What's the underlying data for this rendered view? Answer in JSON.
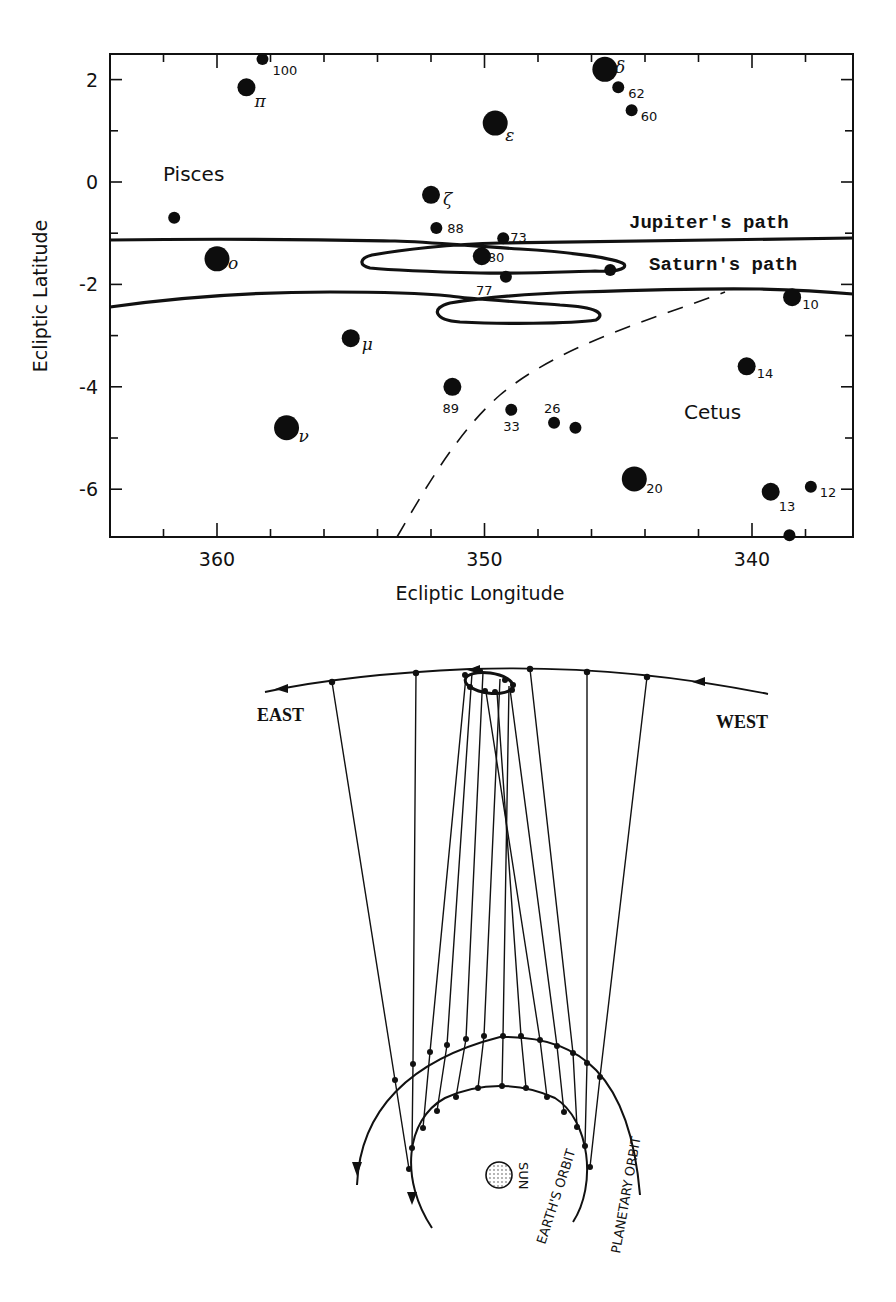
{
  "chart_data": {
    "type": "scatter",
    "title": "",
    "xlabel": "Ecliptic Longitude",
    "ylabel": "Ecliptic Latitude",
    "xlim": [
      364,
      336
    ],
    "ylim": [
      -7,
      2.5
    ],
    "x_ticks": [
      360,
      350,
      340
    ],
    "y_ticks": [
      2,
      0,
      -2,
      -4,
      -6
    ],
    "grid": false,
    "constellations": [
      {
        "name": "Pisces",
        "x": 358.5,
        "y": 0.1
      },
      {
        "name": "Cetus",
        "x": 340.8,
        "y": -4.5
      }
    ],
    "stars": [
      {
        "label": "100",
        "x": 358.3,
        "y": 2.4,
        "size": "small"
      },
      {
        "label": "π",
        "x": 358.9,
        "y": 1.85,
        "size": "medium"
      },
      {
        "label": "δ",
        "x": 345.5,
        "y": 2.2,
        "size": "large"
      },
      {
        "label": "62",
        "x": 345.0,
        "y": 1.85,
        "size": "small"
      },
      {
        "label": "60",
        "x": 344.5,
        "y": 1.4,
        "size": "small"
      },
      {
        "label": "ε",
        "x": 349.6,
        "y": 1.15,
        "size": "large"
      },
      {
        "label": "ζ",
        "x": 352.0,
        "y": -0.25,
        "size": "medium"
      },
      {
        "label": "",
        "x": 361.6,
        "y": -0.7,
        "size": "small"
      },
      {
        "label": "88",
        "x": 351.8,
        "y": -0.9,
        "size": "small"
      },
      {
        "label": "73",
        "x": 349.3,
        "y": -1.1,
        "size": "small"
      },
      {
        "label": "ο",
        "x": 360.0,
        "y": -1.5,
        "size": "large"
      },
      {
        "label": "80",
        "x": 350.1,
        "y": -1.45,
        "size": "medium"
      },
      {
        "label": "77",
        "x": 349.2,
        "y": -1.85,
        "size": "small"
      },
      {
        "label": "",
        "x": 345.3,
        "y": -1.72,
        "size": "small"
      },
      {
        "label": "10",
        "x": 338.5,
        "y": -2.25,
        "size": "medium"
      },
      {
        "label": "μ",
        "x": 355.0,
        "y": -3.05,
        "size": "medium"
      },
      {
        "label": "14",
        "x": 340.2,
        "y": -3.6,
        "size": "medium"
      },
      {
        "label": "89",
        "x": 351.2,
        "y": -4.0,
        "size": "medium"
      },
      {
        "label": "33",
        "x": 349.0,
        "y": -4.45,
        "size": "small"
      },
      {
        "label": "26",
        "x": 347.4,
        "y": -4.7,
        "size": "small"
      },
      {
        "label": "",
        "x": 346.6,
        "y": -4.8,
        "size": "small"
      },
      {
        "label": "ν",
        "x": 357.4,
        "y": -4.8,
        "size": "large"
      },
      {
        "label": "20",
        "x": 344.4,
        "y": -5.8,
        "size": "large"
      },
      {
        "label": "13",
        "x": 339.3,
        "y": -6.05,
        "size": "medium"
      },
      {
        "label": "12",
        "x": 337.8,
        "y": -5.95,
        "size": "small"
      },
      {
        "label": "",
        "x": 338.6,
        "y": -6.9,
        "size": "small"
      }
    ],
    "series": [
      {
        "name": "Jupiter's path",
        "type": "line",
        "x": [
          364,
          356,
          350,
          344,
          336
        ],
        "y": [
          -1.15,
          -1.12,
          -1.18,
          -1.15,
          -1.12
        ],
        "retrograde_loop": {
          "x_range": [
            355.3,
            344.8
          ],
          "y_range": [
            -1.4,
            -1.9
          ]
        }
      },
      {
        "name": "Saturn's path",
        "type": "line",
        "x": [
          364,
          358,
          352,
          346,
          340,
          336
        ],
        "y": [
          -2.45,
          -2.2,
          -2.2,
          -2.3,
          -2.05,
          -2.2
        ],
        "retrograde_loop": {
          "x_range": [
            352.8,
            346.1
          ],
          "y_range": [
            -2.35,
            -2.75
          ]
        }
      },
      {
        "name": "boundary",
        "type": "dashed",
        "x": [
          353.4,
          351.0,
          349.0,
          346.0,
          343.0,
          341.0
        ],
        "y": [
          -7.0,
          -5.0,
          -4.0,
          -3.4,
          -2.8,
          -2.2
        ]
      }
    ]
  },
  "top_chart": {
    "xlabel": "Ecliptic Longitude",
    "ylabel": "Ecliptic Latitude",
    "x_tick_labels": [
      "360",
      "350",
      "340"
    ],
    "y_tick_labels": [
      "2",
      "0",
      "-2",
      "-4",
      "-6"
    ],
    "constellation_labels": [
      "Pisces",
      "Cetus"
    ],
    "path_labels": {
      "jupiter": "Jupiter's path",
      "saturn": "Saturn's path"
    }
  },
  "bottom_diagram": {
    "direction_labels": {
      "east": "EAST",
      "west": "WEST"
    },
    "sun_label": "SUN",
    "earth_orbit_label": "EARTH'S ORBIT",
    "planetary_orbit_label": "PLANETARY ORBIT"
  }
}
